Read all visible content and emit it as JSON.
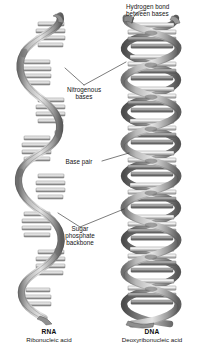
{
  "figure": {
    "background_color": "#ffffff",
    "ink_color": "#141414"
  },
  "callouts": {
    "hydrogen_bond": "Hydrogen bond\nbetween bases",
    "nitrogenous_bases": "Nitrogenous\nbases",
    "base_pair": "Base pair",
    "sugar_phosphate_backbone": "Sugar\nphosphate\nbackbone"
  },
  "molecules": [
    {
      "id": "rna",
      "abbr": "RNA",
      "full_name": "Ribonucleic acid",
      "strands": 1,
      "turns": 4
    },
    {
      "id": "dna",
      "abbr": "DNA",
      "full_name": "Deoxyribonucleic acid",
      "strands": 2,
      "turns": 7
    }
  ],
  "palette": {
    "ribbon_light": "#d2d2d2",
    "ribbon_mid": "#a8a8a8",
    "ribbon_dark": "#6f6f6f",
    "ribbon_shadow": "#4f4f4f",
    "base_light": "#f2f2f2",
    "base_mid": "#b4b4b4",
    "base_dark": "#7c7c7c",
    "outline": "#3c3c3c",
    "leader_line": "#2b2b2b"
  }
}
